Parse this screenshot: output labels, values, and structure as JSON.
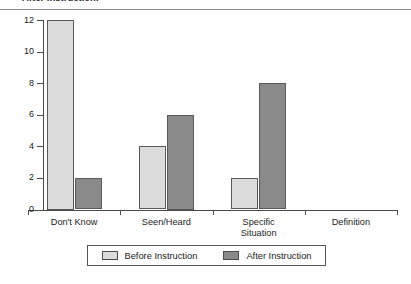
{
  "caption": {
    "text": "After Instruction."
  },
  "chart_data": {
    "type": "bar",
    "title": "",
    "xlabel": "",
    "ylabel": "",
    "ylim": [
      0,
      12
    ],
    "yticks": [
      "0",
      "2",
      "4",
      "6",
      "8",
      "10",
      "12"
    ],
    "grid": false,
    "legend_position": "bottom",
    "categories": [
      "Don't Know",
      "Seen/Heard",
      "Specific Situation",
      "Definition"
    ],
    "category_lines": [
      [
        "Don't Know"
      ],
      [
        "Seen/Heard"
      ],
      [
        "Specific",
        "Situation"
      ],
      [
        "Definition"
      ]
    ],
    "series": [
      {
        "name": "Before Instruction",
        "color": "#dcdcdc",
        "values": [
          12,
          4,
          2,
          0
        ]
      },
      {
        "name": "After Instruction",
        "color": "#8a8a8a",
        "values": [
          2,
          6,
          8,
          0
        ]
      }
    ]
  },
  "legend": {
    "entries": [
      {
        "label": "Before Instruction",
        "color": "#dcdcdc"
      },
      {
        "label": "After Instruction",
        "color": "#8a8a8a"
      }
    ]
  }
}
